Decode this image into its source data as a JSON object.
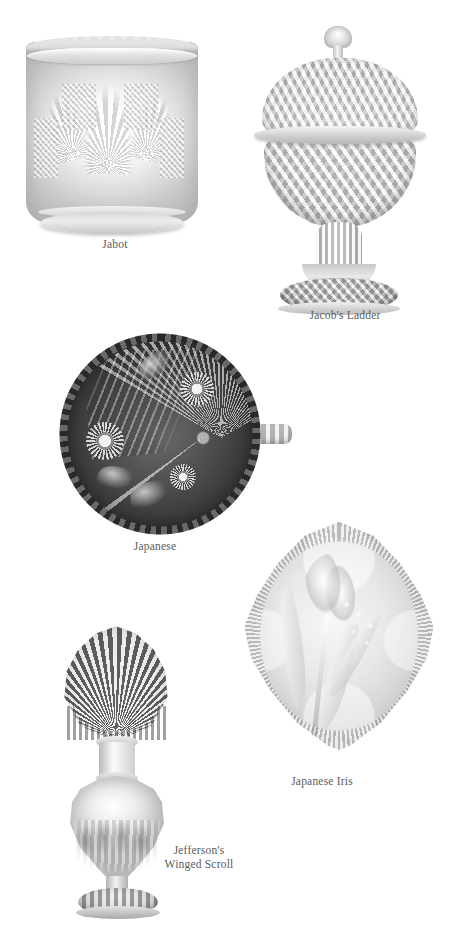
{
  "page": {
    "background_color": "#ffffff",
    "caption_color": "#5b5b5b",
    "kind": "pressed-glass pattern reference plate"
  },
  "figures": [
    {
      "id": "jabot",
      "caption": "Jabot",
      "object_type": "footed spooner / vase",
      "description": "Clear pressed glass cylindrical vase with scalloped rim, fan and diamond star cuttings, round foot"
    },
    {
      "id": "jacobs_ladder",
      "caption": "Jacob's Ladder",
      "object_type": "covered compote",
      "description": "Clear pressed glass lidded compote with pointed finial, domed cover, diamond-lattice bowl, knopped stem and patterned foot"
    },
    {
      "id": "japanese",
      "caption": "Japanese",
      "object_type": "handled nappy / plate",
      "description": "Dark decorated round plate with beaded rim, chrysanthemum flowers, leaves, lace panel and radiating fan, with tab handle at right"
    },
    {
      "id": "japanese_iris",
      "caption": "Japanese Iris",
      "object_type": "quatrefoil dish",
      "description": "Frosted quatrefoil-shaped dish with crimped edge and intaglio iris blossom and leaves"
    },
    {
      "id": "jeffersons_winged_scroll",
      "caption": "Jefferson's\nWinged Scroll",
      "object_type": "perfume bottle",
      "description": "Clear perfume bottle with large fan-shaped shell stopper, urn-shaped body with winged scroll pressing and scalloped foot"
    }
  ]
}
